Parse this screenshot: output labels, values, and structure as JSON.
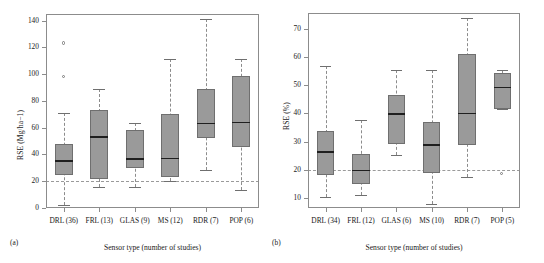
{
  "figure": {
    "panels": [
      {
        "key": "a",
        "panel_label": "(a)",
        "ylabel": "RSE (Mg/ha−1)",
        "xlabel": "Sensor type (number of studies)",
        "yticks": [
          "0",
          "20",
          "40",
          "60",
          "80",
          "100",
          "120",
          "140"
        ],
        "xticks": [
          "DRL (36)",
          "FRL (13)",
          "GLAS (9)",
          "MS (12)",
          "RDR (7)",
          "POP (6)"
        ]
      },
      {
        "key": "b",
        "panel_label": "(b)",
        "ylabel": "RSE (%)",
        "xlabel": "Sensor type (number of studies)",
        "yticks": [
          "10",
          "20",
          "30",
          "40",
          "50",
          "60",
          "70"
        ],
        "xticks": [
          "DRL (34)",
          "FRL (12)",
          "GLAS (6)",
          "MS (10)",
          "RDR (7)",
          "POP (5)"
        ]
      }
    ]
  },
  "chart_data": [
    {
      "type": "box",
      "panel": "(a)",
      "title": "",
      "xlabel": "Sensor type (number of studies)",
      "ylabel": "RSE (Mg/ha−1)",
      "ylim": [
        0,
        145
      ],
      "yticks": [
        0,
        20,
        40,
        60,
        80,
        100,
        120,
        140
      ],
      "grid": false,
      "legend": "none",
      "reference_line": {
        "y": 20,
        "style": "dashed",
        "color": "#9a9a9a"
      },
      "categories": [
        "DRL (36)",
        "FRL (13)",
        "GLAS (9)",
        "MS (12)",
        "RDR (7)",
        "POP (6)"
      ],
      "boxes": [
        {
          "category": "DRL (36)",
          "n": 36,
          "whisker_low": 2.5,
          "q1": 24.5,
          "median": 35.2,
          "q3": 47.5,
          "whisker_high": 71.0,
          "outliers": [
            98.0,
            123.0
          ]
        },
        {
          "category": "FRL (13)",
          "n": 13,
          "whisker_low": 15.8,
          "q1": 21.8,
          "median": 53.0,
          "q3": 73.3,
          "whisker_high": 89.0,
          "outliers": []
        },
        {
          "category": "GLAS (9)",
          "n": 9,
          "whisker_low": 15.5,
          "q1": 29.8,
          "median": 36.5,
          "q3": 58.0,
          "whisker_high": 63.3,
          "outliers": []
        },
        {
          "category": "MS (12)",
          "n": 12,
          "whisker_low": 20.5,
          "q1": 23.2,
          "median": 37.0,
          "q3": 70.5,
          "whisker_high": 111.0,
          "outliers": []
        },
        {
          "category": "RDR (7)",
          "n": 7,
          "whisker_low": 28.5,
          "q1": 52.0,
          "median": 63.2,
          "q3": 89.0,
          "whisker_high": 141.0,
          "outliers": []
        },
        {
          "category": "POP (6)",
          "n": 6,
          "whisker_low": 13.5,
          "q1": 45.5,
          "median": 64.0,
          "q3": 98.3,
          "whisker_high": 111.5,
          "outliers": []
        }
      ]
    },
    {
      "type": "box",
      "panel": "(b)",
      "title": "",
      "xlabel": "Sensor type (number of studies)",
      "ylabel": "RSE (%)",
      "ylim": [
        6.5,
        75.5
      ],
      "yticks": [
        10,
        20,
        30,
        40,
        50,
        60,
        70
      ],
      "grid": false,
      "legend": "none",
      "reference_line": {
        "y": 20,
        "style": "dashed",
        "color": "#9a9a9a"
      },
      "categories": [
        "DRL (34)",
        "FRL (12)",
        "GLAS (6)",
        "MS (10)",
        "RDR (7)",
        "POP (5)"
      ],
      "boxes": [
        {
          "category": "DRL (34)",
          "n": 34,
          "whisker_low": 10.3,
          "q1": 18.0,
          "median": 26.4,
          "q3": 33.9,
          "whisker_high": 56.9,
          "outliers": []
        },
        {
          "category": "FRL (12)",
          "n": 12,
          "whisker_low": 11.2,
          "q1": 15.0,
          "median": 19.7,
          "q3": 25.5,
          "whisker_high": 37.7,
          "outliers": []
        },
        {
          "category": "GLAS (6)",
          "n": 6,
          "whisker_low": 25.2,
          "q1": 29.1,
          "median": 39.7,
          "q3": 46.5,
          "whisker_high": 55.4,
          "outliers": []
        },
        {
          "category": "MS (10)",
          "n": 10,
          "whisker_low": 7.9,
          "q1": 19.0,
          "median": 28.8,
          "q3": 36.8,
          "whisker_high": 55.4,
          "outliers": []
        },
        {
          "category": "RDR (7)",
          "n": 7,
          "whisker_low": 17.3,
          "q1": 28.8,
          "median": 39.9,
          "q3": 60.9,
          "whisker_high": 73.8,
          "outliers": []
        },
        {
          "category": "POP (5)",
          "n": 5,
          "whisker_low": 41.5,
          "q1": 41.5,
          "median": 49.2,
          "q3": 54.4,
          "whisker_high": 55.2,
          "outliers": [
            18.6
          ]
        }
      ]
    }
  ]
}
